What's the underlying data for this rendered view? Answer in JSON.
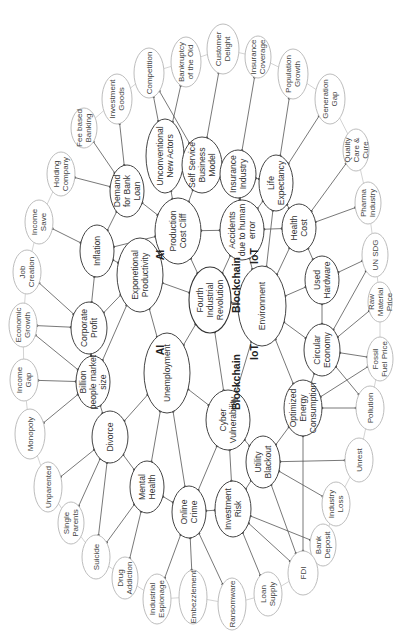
{
  "diagram": {
    "orientation": "rotated -90deg",
    "center": {
      "id": "fir",
      "lines": [
        "Fourth",
        "Industrial",
        "Revolution"
      ],
      "x": 210,
      "y": 300,
      "rx": 21,
      "ry": 33
    },
    "technology_labels": [
      {
        "text": "AI",
        "x": 164,
        "y": 255
      },
      {
        "text": "AI",
        "x": 164,
        "y": 350
      },
      {
        "text": "IoT",
        "x": 258,
        "y": 256
      },
      {
        "text": "IoT",
        "x": 258,
        "y": 352
      },
      {
        "text": "Blockchain",
        "x": 240,
        "y": 285
      },
      {
        "text": "Blockchain",
        "x": 240,
        "y": 382
      }
    ],
    "inner_nodes": [
      {
        "id": "pcc",
        "lines": [
          "Production",
          "Cost Cliff"
        ],
        "x": 178,
        "y": 231,
        "rx": 23,
        "ry": 33
      },
      {
        "id": "ep",
        "lines": [
          "Exponetional",
          "Productivity"
        ],
        "x": 140,
        "y": 275,
        "rx": 23,
        "ry": 37
      },
      {
        "id": "unemp",
        "lines": [
          "Unemployment"
        ],
        "x": 167,
        "y": 373,
        "rx": 23,
        "ry": 40
      },
      {
        "id": "cv",
        "lines": [
          "Cyber",
          "Vulnerability"
        ],
        "x": 228,
        "y": 420,
        "rx": 22,
        "ry": 30
      },
      {
        "id": "env",
        "lines": [
          "Environment"
        ],
        "x": 262,
        "y": 306,
        "rx": 24,
        "ry": 40
      },
      {
        "id": "accid",
        "lines": [
          "Accidents",
          "due to human",
          "error"
        ],
        "x": 242,
        "y": 230,
        "rx": 22,
        "ry": 30
      },
      {
        "id": "dbl",
        "lines": [
          "Demand",
          "for Bank",
          "Loan"
        ],
        "x": 127,
        "y": 191,
        "rx": 17,
        "ry": 26
      },
      {
        "id": "unc",
        "lines": [
          "Unconventional",
          "New Actors"
        ],
        "x": 165,
        "y": 156,
        "rx": 19,
        "ry": 37
      },
      {
        "id": "ssbm",
        "lines": [
          "Self Service",
          "Business",
          "Model"
        ],
        "x": 202,
        "y": 165,
        "rx": 20,
        "ry": 28
      },
      {
        "id": "ins",
        "lines": [
          "Insurance",
          "Industry"
        ],
        "x": 238,
        "y": 174,
        "rx": 18,
        "ry": 24
      },
      {
        "id": "le",
        "lines": [
          "Life",
          "Expectancy"
        ],
        "x": 276,
        "y": 183,
        "rx": 17,
        "ry": 28
      },
      {
        "id": "hc",
        "lines": [
          "Health",
          "Cost"
        ],
        "x": 299,
        "y": 228,
        "rx": 17,
        "ry": 24
      },
      {
        "id": "uh",
        "lines": [
          "Used",
          "Hardware"
        ],
        "x": 322,
        "y": 280,
        "rx": 17,
        "ry": 24
      },
      {
        "id": "ce",
        "lines": [
          "Circular",
          "Economy"
        ],
        "x": 322,
        "y": 350,
        "rx": 18,
        "ry": 26
      },
      {
        "id": "oec",
        "lines": [
          "Optimized",
          "Energy",
          "Consumption"
        ],
        "x": 303,
        "y": 408,
        "rx": 19,
        "ry": 28
      },
      {
        "id": "ub",
        "lines": [
          "Utility",
          "Blackout"
        ],
        "x": 263,
        "y": 462,
        "rx": 17,
        "ry": 26
      },
      {
        "id": "ir",
        "lines": [
          "Investment",
          "Risk"
        ],
        "x": 233,
        "y": 509,
        "rx": 18,
        "ry": 28
      },
      {
        "id": "oc",
        "lines": [
          "Online",
          "Crime"
        ],
        "x": 189,
        "y": 512,
        "rx": 17,
        "ry": 26
      },
      {
        "id": "mh",
        "lines": [
          "Mental",
          "Health"
        ],
        "x": 147,
        "y": 487,
        "rx": 17,
        "ry": 26
      },
      {
        "id": "div",
        "lines": [
          "Divorce"
        ],
        "x": 110,
        "y": 437,
        "rx": 18,
        "ry": 26
      },
      {
        "id": "bpms",
        "lines": [
          "Billion",
          "people market",
          "size"
        ],
        "x": 93,
        "y": 382,
        "rx": 17,
        "ry": 26
      },
      {
        "id": "cp",
        "lines": [
          "Corporate",
          "Profit"
        ],
        "x": 89,
        "y": 328,
        "rx": 18,
        "ry": 26
      },
      {
        "id": "infl",
        "lines": [
          "Inflation"
        ],
        "x": 97,
        "y": 251,
        "rx": 17,
        "ry": 26
      }
    ],
    "outer_nodes": [
      {
        "id": "fbb",
        "lines": [
          "Fee based",
          "Banking"
        ],
        "x": 84,
        "y": 128,
        "rx": 13,
        "ry": 20
      },
      {
        "id": "ig",
        "lines": [
          "Investment",
          "Goods"
        ],
        "x": 117,
        "y": 99,
        "rx": 15,
        "ry": 25
      },
      {
        "id": "comp",
        "lines": [
          "Competition"
        ],
        "x": 149,
        "y": 73,
        "rx": 15,
        "ry": 25
      },
      {
        "id": "boo",
        "lines": [
          "Bankruptcy",
          "of the Old"
        ],
        "x": 186,
        "y": 62,
        "rx": 15,
        "ry": 25
      },
      {
        "id": "cd",
        "lines": [
          "Customer",
          "Delight"
        ],
        "x": 223,
        "y": 49,
        "rx": 16,
        "ry": 25
      },
      {
        "id": "ic",
        "lines": [
          "Insurance",
          "Coverage"
        ],
        "x": 258,
        "y": 57,
        "rx": 13,
        "ry": 21
      },
      {
        "id": "pg",
        "lines": [
          "Population",
          "Growth"
        ],
        "x": 293,
        "y": 74,
        "rx": 15,
        "ry": 25
      },
      {
        "id": "gg",
        "lines": [
          "Generation",
          "Gap"
        ],
        "x": 330,
        "y": 99,
        "rx": 15,
        "ry": 25
      },
      {
        "id": "qcc",
        "lines": [
          "Quality",
          "Care &",
          "Cure"
        ],
        "x": 356,
        "y": 150,
        "rx": 13,
        "ry": 21
      },
      {
        "id": "pi",
        "lines": [
          "Pharma",
          "Industry"
        ],
        "x": 368,
        "y": 203,
        "rx": 13,
        "ry": 21
      },
      {
        "id": "unsdg",
        "lines": [
          "UN SDG"
        ],
        "x": 375,
        "y": 255,
        "rx": 13,
        "ry": 22
      },
      {
        "id": "rmp",
        "lines": [
          "Raw",
          "Material",
          "Price"
        ],
        "x": 380,
        "y": 302,
        "rx": 12,
        "ry": 20
      },
      {
        "id": "ffp",
        "lines": [
          "Fossil",
          "Fuel Price"
        ],
        "x": 380,
        "y": 359,
        "rx": 13,
        "ry": 22
      },
      {
        "id": "poll",
        "lines": [
          "Pollution"
        ],
        "x": 370,
        "y": 408,
        "rx": 14,
        "ry": 22
      },
      {
        "id": "unrest",
        "lines": [
          "Unrest"
        ],
        "x": 359,
        "y": 460,
        "rx": 14,
        "ry": 22
      },
      {
        "id": "il",
        "lines": [
          "Industry",
          "Loss"
        ],
        "x": 336,
        "y": 504,
        "rx": 14,
        "ry": 22
      },
      {
        "id": "bd",
        "lines": [
          "Bank",
          "Deposit"
        ],
        "x": 323,
        "y": 545,
        "rx": 13,
        "ry": 21
      },
      {
        "id": "fdi",
        "lines": [
          "FDI"
        ],
        "x": 303,
        "y": 573,
        "rx": 15,
        "ry": 22
      },
      {
        "id": "ls",
        "lines": [
          "Loan",
          "Supply"
        ],
        "x": 268,
        "y": 594,
        "rx": 14,
        "ry": 22
      },
      {
        "id": "ran",
        "lines": [
          "Ransomware"
        ],
        "x": 232,
        "y": 604,
        "rx": 14,
        "ry": 26
      },
      {
        "id": "emb",
        "lines": [
          "Embezzlement"
        ],
        "x": 193,
        "y": 597,
        "rx": 14,
        "ry": 27
      },
      {
        "id": "ie",
        "lines": [
          "Industrial",
          "Espionage"
        ],
        "x": 157,
        "y": 599,
        "rx": 14,
        "ry": 25
      },
      {
        "id": "da",
        "lines": [
          "Drug",
          "Addiction"
        ],
        "x": 125,
        "y": 578,
        "rx": 13,
        "ry": 21
      },
      {
        "id": "sui",
        "lines": [
          "Suicide"
        ],
        "x": 96,
        "y": 557,
        "rx": 14,
        "ry": 22
      },
      {
        "id": "sp",
        "lines": [
          "Single",
          "Parents"
        ],
        "x": 71,
        "y": 523,
        "rx": 13,
        "ry": 21
      },
      {
        "id": "unp",
        "lines": [
          "Unparented"
        ],
        "x": 48,
        "y": 487,
        "rx": 14,
        "ry": 25
      },
      {
        "id": "mono",
        "lines": [
          "Monopoly"
        ],
        "x": 30,
        "y": 434,
        "rx": 15,
        "ry": 25
      },
      {
        "id": "ingap",
        "lines": [
          "Income",
          "Gap"
        ],
        "x": 24,
        "y": 380,
        "rx": 14,
        "ry": 21
      },
      {
        "id": "eg",
        "lines": [
          "Economic",
          "Growth"
        ],
        "x": 23,
        "y": 325,
        "rx": 14,
        "ry": 22
      },
      {
        "id": "jc",
        "lines": [
          "Job",
          "Creation"
        ],
        "x": 27,
        "y": 272,
        "rx": 14,
        "ry": 22
      },
      {
        "id": "is",
        "lines": [
          "Income",
          "Save"
        ],
        "x": 39,
        "y": 222,
        "rx": 14,
        "ry": 22
      },
      {
        "id": "hcomp",
        "lines": [
          "Holding",
          "Company"
        ],
        "x": 61,
        "y": 174,
        "rx": 14,
        "ry": 22
      }
    ],
    "edges": [
      [
        "fir",
        "pcc"
      ],
      [
        "fir",
        "ep"
      ],
      [
        "fir",
        "unemp"
      ],
      [
        "fir",
        "cv"
      ],
      [
        "fir",
        "env"
      ],
      [
        "fir",
        "accid"
      ],
      [
        "pcc",
        "ep"
      ],
      [
        "pcc",
        "accid"
      ],
      [
        "pcc",
        "dbl"
      ],
      [
        "pcc",
        "unc"
      ],
      [
        "pcc",
        "ssbm"
      ],
      [
        "pcc",
        "infl"
      ],
      [
        "ep",
        "infl"
      ],
      [
        "ep",
        "cp"
      ],
      [
        "ep",
        "bpms"
      ],
      [
        "ep",
        "unemp"
      ],
      [
        "unemp",
        "div"
      ],
      [
        "unemp",
        "mh"
      ],
      [
        "unemp",
        "oc"
      ],
      [
        "unemp",
        "cv"
      ],
      [
        "cv",
        "oc"
      ],
      [
        "cv",
        "ir"
      ],
      [
        "cv",
        "ub"
      ],
      [
        "cv",
        "env"
      ],
      [
        "env",
        "accid"
      ],
      [
        "env",
        "le"
      ],
      [
        "env",
        "hc"
      ],
      [
        "env",
        "uh"
      ],
      [
        "env",
        "ce"
      ],
      [
        "env",
        "oec"
      ],
      [
        "accid",
        "ins"
      ],
      [
        "accid",
        "le"
      ],
      [
        "accid",
        "hc"
      ],
      [
        "dbl",
        "infl"
      ],
      [
        "dbl",
        "fbb"
      ],
      [
        "dbl",
        "hcomp"
      ],
      [
        "dbl",
        "ig"
      ],
      [
        "unc",
        "comp"
      ],
      [
        "unc",
        "boo"
      ],
      [
        "unc",
        "ssbm"
      ],
      [
        "ssbm",
        "comp"
      ],
      [
        "ssbm",
        "cd"
      ],
      [
        "ssbm",
        "ins"
      ],
      [
        "ins",
        "ic"
      ],
      [
        "ins",
        "le"
      ],
      [
        "le",
        "pg"
      ],
      [
        "le",
        "gg"
      ],
      [
        "le",
        "hc"
      ],
      [
        "hc",
        "qcc"
      ],
      [
        "hc",
        "pi"
      ],
      [
        "hc",
        "uh"
      ],
      [
        "uh",
        "unsdg"
      ],
      [
        "uh",
        "ce"
      ],
      [
        "ce",
        "unsdg"
      ],
      [
        "ce",
        "rmp"
      ],
      [
        "ce",
        "ffp"
      ],
      [
        "ce",
        "poll"
      ],
      [
        "ce",
        "oec"
      ],
      [
        "oec",
        "ffp"
      ],
      [
        "oec",
        "poll"
      ],
      [
        "oec",
        "ub"
      ],
      [
        "oec",
        "fdi"
      ],
      [
        "ub",
        "unrest"
      ],
      [
        "ub",
        "il"
      ],
      [
        "ub",
        "ir"
      ],
      [
        "ub",
        "fdi"
      ],
      [
        "ir",
        "bd"
      ],
      [
        "ir",
        "fdi"
      ],
      [
        "ir",
        "ls"
      ],
      [
        "ir",
        "oc"
      ],
      [
        "oc",
        "ran"
      ],
      [
        "oc",
        "emb"
      ],
      [
        "oc",
        "ie"
      ],
      [
        "oc",
        "mh"
      ],
      [
        "mh",
        "da"
      ],
      [
        "mh",
        "sui"
      ],
      [
        "mh",
        "div"
      ],
      [
        "div",
        "sui"
      ],
      [
        "div",
        "sp"
      ],
      [
        "div",
        "unp"
      ],
      [
        "div",
        "bpms"
      ],
      [
        "bpms",
        "mono"
      ],
      [
        "bpms",
        "ingap"
      ],
      [
        "bpms",
        "eg"
      ],
      [
        "bpms",
        "cp"
      ],
      [
        "cp",
        "eg"
      ],
      [
        "cp",
        "jc"
      ],
      [
        "cp",
        "infl"
      ],
      [
        "infl",
        "is"
      ]
    ],
    "ring_order": [
      "fbb",
      "ig",
      "comp",
      "boo",
      "cd",
      "ic",
      "pg",
      "gg",
      "qcc",
      "pi",
      "unsdg",
      "rmp",
      "ffp",
      "poll",
      "unrest",
      "il",
      "bd",
      "fdi",
      "ls",
      "ran",
      "emb",
      "ie",
      "da",
      "sui",
      "sp",
      "unp",
      "mono",
      "ingap",
      "eg",
      "jc",
      "is",
      "hcomp"
    ],
    "colors": {
      "inner_stroke": "#444444",
      "outer_stroke": "#bdbdbd",
      "edge": "#555555",
      "ring": "#c8c8c8",
      "text": "#333333"
    }
  }
}
